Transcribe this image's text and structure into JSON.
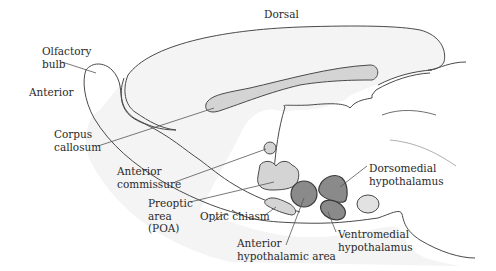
{
  "figure": {
    "orientation_labels": {
      "dorsal": "Dorsal",
      "anterior": "Anterior"
    },
    "structures": [
      {
        "id": "olfactory-bulb",
        "lines": [
          "Olfactory",
          "bulb"
        ]
      },
      {
        "id": "corpus-callosum",
        "lines": [
          "Corpus",
          "callosum"
        ]
      },
      {
        "id": "anterior-commissure",
        "lines": [
          "Anterior",
          "commissure"
        ]
      },
      {
        "id": "preoptic-area",
        "lines": [
          "Preoptic",
          "area",
          "(POA)"
        ]
      },
      {
        "id": "optic-chiasm",
        "lines": [
          "Optic chiasm"
        ]
      },
      {
        "id": "anterior-hypothalamic-area",
        "lines": [
          "Anterior",
          "hypothalamic area"
        ]
      },
      {
        "id": "dorsomedial-hypothalamus",
        "lines": [
          "Dorsomedial",
          "hypothalamus"
        ]
      },
      {
        "id": "ventromedial-hypothalamus",
        "lines": [
          "Ventromedial",
          "hypothalamus"
        ]
      }
    ],
    "colors": {
      "brain_fill": "#f4f4f4",
      "outline": "#4a4a4a",
      "light_gray_region": "#d4d4d4",
      "dark_gray_region": "#8a8a8a",
      "leader_line": "#555555"
    }
  }
}
